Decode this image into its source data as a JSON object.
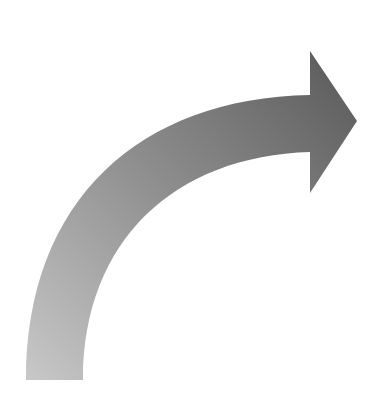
{
  "figure": {
    "type": "curved-arrow",
    "direction": "up-then-right",
    "colors": {
      "background": "#ffffff",
      "gradient_start": "#c4c4c4",
      "gradient_mid": "#8c8c8c",
      "gradient_end": "#5a5a5a"
    }
  }
}
